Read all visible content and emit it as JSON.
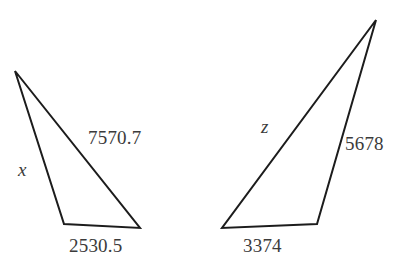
{
  "figure": {
    "background_color": "#ffffff",
    "stroke_color": "#1c1c1c",
    "text_color": "#3b3b3b",
    "stroke_width": 2,
    "width": 405,
    "height": 269,
    "triangles": [
      {
        "id": "left-triangle",
        "orientation": "apex-top-left",
        "vertices": {
          "apex": [
            15,
            71
          ],
          "bottom_left": [
            64,
            224
          ],
          "bottom_right": [
            140,
            228
          ]
        },
        "labels": {
          "hypotenuse": "7570.7",
          "left_side": "x",
          "base": "2530.5"
        }
      },
      {
        "id": "right-triangle",
        "orientation": "apex-top-right",
        "vertices": {
          "apex": [
            376,
            20
          ],
          "bottom_left": [
            222,
            228
          ],
          "bottom_right": [
            317,
            224
          ]
        },
        "labels": {
          "hypotenuse": "z",
          "right_side": "5678",
          "base": "3374"
        }
      }
    ]
  }
}
